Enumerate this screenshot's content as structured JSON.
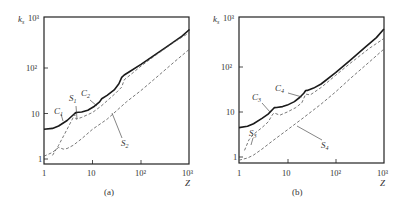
{
  "chart_data": [
    {
      "panel": "a",
      "type": "line",
      "caption": "(a)",
      "xlabel": "Z",
      "ylabel": "k_s",
      "xscale": "log",
      "yscale": "log",
      "xlim": [
        1,
        1000
      ],
      "ylim": [
        0.9,
        1000
      ],
      "x_ticks": [
        "1",
        "10",
        "10²",
        "10³"
      ],
      "y_ticks": [
        "1",
        "10",
        "10²",
        "10³"
      ],
      "grid": false,
      "series": [
        {
          "name": "solid (C1, C2)",
          "style": "solid",
          "x": [
            1,
            1.5,
            2,
            3,
            4.3,
            4.6,
            6,
            8,
            11,
            14,
            15.5,
            20,
            28,
            35,
            40,
            45,
            60,
            100,
            200,
            400,
            700,
            1000
          ],
          "y": [
            4.5,
            4.7,
            5.3,
            7,
            10,
            10.5,
            10.8,
            11.8,
            14.5,
            18,
            21,
            25,
            33,
            45,
            62,
            70,
            85,
            120,
            200,
            330,
            500,
            700
          ]
        },
        {
          "name": "S1",
          "style": "dashed",
          "x": [
            1.5,
            2,
            3,
            4.3,
            4.6,
            6,
            10,
            15,
            20,
            30,
            40,
            45,
            60,
            100,
            200,
            500,
            1000
          ],
          "y": [
            1.2,
            2,
            4.5,
            9.5,
            7.5,
            8.2,
            10.5,
            14.5,
            19,
            28,
            38,
            55,
            70,
            110,
            190,
            380,
            600
          ]
        },
        {
          "name": "S2",
          "style": "dashed",
          "x": [
            1,
            1.5,
            2,
            2.5,
            3,
            4,
            6,
            10,
            20,
            50,
            100,
            200,
            500,
            1000
          ],
          "y": [
            1.15,
            1.4,
            1.8,
            1.65,
            1.7,
            2.0,
            2.8,
            4.5,
            7.5,
            18,
            32,
            60,
            140,
            260
          ]
        }
      ],
      "annotations": [
        {
          "text": "C",
          "sub": "1",
          "x": 1.8,
          "y": 10.5
        },
        {
          "text": "S",
          "sub": "1",
          "x": 3.5,
          "y": 19
        },
        {
          "text": "C",
          "sub": "2",
          "x": 7.5,
          "y": 26
        },
        {
          "text": "S",
          "sub": "2",
          "x": 60,
          "y": 2.5
        }
      ]
    },
    {
      "panel": "b",
      "type": "line",
      "caption": "(b)",
      "xlabel": "Z",
      "ylabel": "k_s",
      "xscale": "log",
      "yscale": "log",
      "xlim": [
        1,
        1000
      ],
      "ylim": [
        0.85,
        1000
      ],
      "x_ticks": [
        "1",
        "10",
        "10²",
        "10³"
      ],
      "y_ticks": [
        "1",
        "10",
        "10²",
        "10³"
      ],
      "grid": false,
      "series": [
        {
          "name": "solid (C3, C4)",
          "style": "solid",
          "x": [
            1,
            1.5,
            2,
            3,
            4,
            5,
            5.4,
            6,
            8,
            10,
            14,
            18,
            22,
            24,
            26,
            35,
            50,
            100,
            200,
            400,
            700,
            1000
          ],
          "y": [
            4.5,
            4.8,
            5.5,
            7.2,
            9,
            11.5,
            12.5,
            12.6,
            13.2,
            14.2,
            17,
            21,
            26,
            30,
            30.2,
            34,
            42,
            75,
            140,
            270,
            450,
            700
          ]
        },
        {
          "name": "S3",
          "style": "dashed",
          "x": [
            1.3,
            1.6,
            2,
            3,
            4,
            5,
            5.4,
            7,
            10,
            15,
            20,
            24,
            30,
            50,
            100,
            200,
            500,
            1000
          ],
          "y": [
            1.4,
            2.4,
            3.2,
            4.5,
            6,
            9,
            9.5,
            8.5,
            10,
            12.5,
            16,
            25,
            24,
            35,
            65,
            120,
            260,
            430
          ]
        },
        {
          "name": "S4",
          "style": "dashed",
          "x": [
            1,
            1.5,
            2,
            3,
            5,
            10,
            20,
            50,
            100,
            200,
            500,
            1000
          ],
          "y": [
            0.85,
            0.95,
            1.1,
            1.5,
            2.3,
            4,
            7,
            15,
            28,
            55,
            130,
            250
          ]
        }
      ],
      "annotations": [
        {
          "text": "C",
          "sub": "3",
          "x": 2.5,
          "y": 17
        },
        {
          "text": "C",
          "sub": "4",
          "x": 7.5,
          "y": 28
        },
        {
          "text": "S",
          "sub": "3",
          "x": 1.3,
          "y": 4.2
        },
        {
          "text": "S",
          "sub": "4",
          "x": 60,
          "y": 3
        }
      ]
    }
  ],
  "panels": {
    "a": {
      "caption": "(a)",
      "ylabel": "k",
      "ylabel_sub": "s",
      "xlabel": "Z",
      "y_top_label": "10³",
      "ticks_x": [
        "1",
        "10",
        "10²",
        "10³"
      ],
      "ticks_y": [
        "1",
        "10",
        "10²"
      ],
      "labels": {
        "C1": "C",
        "C1_sub": "1",
        "S1": "S",
        "S1_sub": "1",
        "C2": "C",
        "C2_sub": "2",
        "S2": "S",
        "S2_sub": "2"
      }
    },
    "b": {
      "caption": "(b)",
      "ylabel": "k",
      "ylabel_sub": "s",
      "xlabel": "Z",
      "y_top_label": "10³",
      "ticks_x": [
        "1",
        "10",
        "10²",
        "10³"
      ],
      "ticks_y": [
        "1",
        "10",
        "10²"
      ],
      "labels": {
        "C3": "C",
        "C3_sub": "3",
        "C4": "C",
        "C4_sub": "4",
        "S3": "S",
        "S3_sub": "3",
        "S4": "S",
        "S4_sub": "4"
      }
    }
  },
  "colors": {
    "line": "#1a1a1a",
    "dashed": "#555555",
    "axis": "#222222",
    "text": "#333333"
  }
}
